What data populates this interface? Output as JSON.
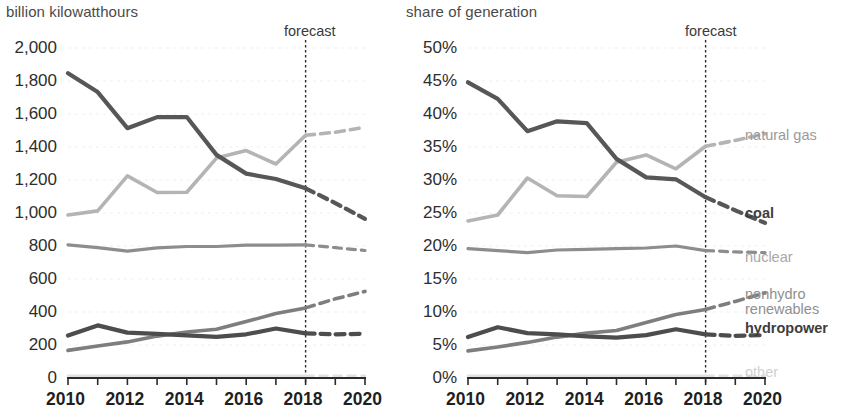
{
  "left": {
    "axis_title": "billion kilowatthours",
    "forecast_label": "forecast",
    "forecast_year": 2018,
    "y_ticks": [
      "2,000",
      "1,800",
      "1,600",
      "1,400",
      "1,200",
      "1,000",
      "800",
      "600",
      "400",
      "200",
      "0"
    ],
    "x_ticks": [
      "2010",
      "2012",
      "2014",
      "2016",
      "2018",
      "2020"
    ]
  },
  "right": {
    "axis_title": "share of generation",
    "forecast_label": "forecast",
    "forecast_year": 2018,
    "y_ticks": [
      "50%",
      "45%",
      "40%",
      "35%",
      "30%",
      "25%",
      "20%",
      "15%",
      "10%",
      "5%",
      "0%"
    ],
    "x_ticks": [
      "2010",
      "2012",
      "2014",
      "2016",
      "2018",
      "2020"
    ],
    "legend": [
      {
        "key": "natural_gas",
        "label": "natural gas"
      },
      {
        "key": "coal",
        "label": "coal"
      },
      {
        "key": "nuclear",
        "label": "nuclear"
      },
      {
        "key": "nonhydro_renewables_line1",
        "label": "nonhydro"
      },
      {
        "key": "nonhydro_renewables_line2",
        "label": "renewables"
      },
      {
        "key": "hydropower",
        "label": "hydropower"
      },
      {
        "key": "other",
        "label": "other"
      }
    ]
  },
  "colors": {
    "coal": "#575757",
    "natural_gas": "#b4b4b4",
    "nuclear": "#8d8d8d",
    "nonhydro_renewables": "#7e7e7e",
    "hydropower": "#4d4d4d",
    "other": "#e2e2e2",
    "axis": "#2b2b2b",
    "grid": "#efefef"
  },
  "chart_data": [
    {
      "type": "line",
      "id": "generation-absolute",
      "title": "billion kilowatthours",
      "xlabel": "",
      "ylabel": "billion kilowatthours",
      "x": [
        2010,
        2011,
        2012,
        2013,
        2014,
        2015,
        2016,
        2017,
        2018,
        2019,
        2020
      ],
      "xlim": [
        2010,
        2020
      ],
      "ylim": [
        0,
        2000
      ],
      "ytick_step": 200,
      "grid": true,
      "legend_position": "none",
      "forecast_start": 2018,
      "annotations": [
        {
          "text": "forecast",
          "x": 2018
        }
      ],
      "series": [
        {
          "name": "coal",
          "values": [
            1847,
            1733,
            1514,
            1581,
            1582,
            1352,
            1239,
            1206,
            1150,
            1060,
            965
          ]
        },
        {
          "name": "natural gas",
          "values": [
            988,
            1013,
            1225,
            1124,
            1126,
            1333,
            1378,
            1297,
            1471,
            1490,
            1520
          ]
        },
        {
          "name": "nuclear",
          "values": [
            807,
            790,
            769,
            789,
            797,
            797,
            805,
            805,
            807,
            790,
            773
          ]
        },
        {
          "name": "nonhydro renewables",
          "values": [
            167,
            194,
            219,
            254,
            279,
            295,
            342,
            390,
            425,
            480,
            525
          ]
        },
        {
          "name": "hydropower",
          "values": [
            257,
            319,
            275,
            268,
            259,
            249,
            265,
            300,
            270,
            265,
            268
          ]
        },
        {
          "name": "other",
          "values": [
            14,
            14,
            14,
            14,
            14,
            14,
            14,
            14,
            14,
            14,
            14
          ]
        }
      ]
    },
    {
      "type": "line",
      "id": "generation-share",
      "title": "share of generation",
      "xlabel": "",
      "ylabel": "share of generation",
      "x": [
        2010,
        2011,
        2012,
        2013,
        2014,
        2015,
        2016,
        2017,
        2018,
        2019,
        2020
      ],
      "xlim": [
        2010,
        2020
      ],
      "ylim": [
        0,
        50
      ],
      "ytick_step": 5,
      "unit": "%",
      "grid": true,
      "legend_position": "right",
      "forecast_start": 2018,
      "annotations": [
        {
          "text": "forecast",
          "x": 2018
        }
      ],
      "series": [
        {
          "name": "coal",
          "values": [
            44.8,
            42.3,
            37.4,
            38.9,
            38.6,
            33.2,
            30.4,
            30.1,
            27.4,
            25.4,
            23.5
          ]
        },
        {
          "name": "natural gas",
          "values": [
            23.8,
            24.7,
            30.3,
            27.6,
            27.5,
            32.7,
            33.8,
            31.7,
            35.1,
            36.0,
            37.0
          ]
        },
        {
          "name": "nuclear",
          "values": [
            19.6,
            19.3,
            19.0,
            19.4,
            19.5,
            19.6,
            19.7,
            20.0,
            19.3,
            19.1,
            19.0
          ]
        },
        {
          "name": "nonhydro renewables",
          "values": [
            4.1,
            4.7,
            5.4,
            6.2,
            6.8,
            7.2,
            8.4,
            9.6,
            10.4,
            11.6,
            12.9
          ]
        },
        {
          "name": "hydropower",
          "values": [
            6.2,
            7.7,
            6.8,
            6.6,
            6.3,
            6.1,
            6.5,
            7.4,
            6.6,
            6.4,
            6.5
          ]
        },
        {
          "name": "other",
          "values": [
            0.35,
            0.35,
            0.35,
            0.35,
            0.35,
            0.35,
            0.35,
            0.35,
            0.35,
            0.35,
            0.35
          ]
        }
      ]
    }
  ]
}
